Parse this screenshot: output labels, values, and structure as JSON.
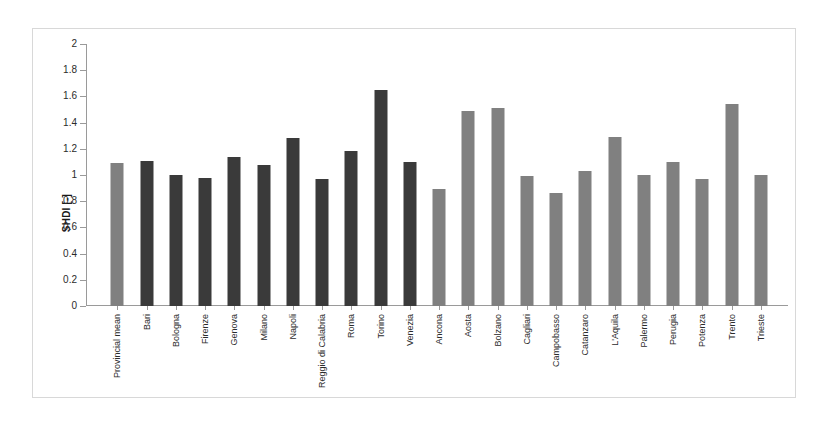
{
  "chart_data": {
    "type": "bar",
    "title": "",
    "xlabel": "",
    "ylabel": "SHDI [-]",
    "ylim": [
      0,
      2
    ],
    "ytick_labels": [
      "2",
      "1.8",
      "1.6",
      "1.4",
      "1.2",
      "1",
      "0.8",
      "0.6",
      "0.4",
      "0.2",
      "0"
    ],
    "ytick_values": [
      2,
      1.8,
      1.6,
      1.4,
      1.2,
      1,
      0.8,
      0.6,
      0.4,
      0.2,
      0
    ],
    "grid": false,
    "legend": "none",
    "categories": [
      "Provincial mean",
      "Bari",
      "Bologna",
      "Firenze",
      "Genova",
      "Milano",
      "Napoli",
      "Reggio di Calabria",
      "Roma",
      "Torino",
      "Venezia",
      "Ancona",
      "Aosta",
      "Bolzano",
      "Cagliari",
      "Campobasso",
      "Catanzaro",
      "L'Aquila",
      "Palermo",
      "Perugia",
      "Potenza",
      "Trento",
      "Trieste"
    ],
    "values": [
      1.09,
      1.11,
      1.0,
      0.98,
      1.14,
      1.08,
      1.28,
      0.97,
      1.18,
      1.65,
      1.1,
      0.89,
      1.49,
      1.51,
      0.99,
      0.86,
      1.03,
      1.29,
      1.0,
      1.1,
      0.97,
      1.54,
      1.0
    ],
    "bar_colors": [
      "light",
      "dark",
      "dark",
      "dark",
      "dark",
      "dark",
      "dark",
      "dark",
      "dark",
      "dark",
      "dark",
      "light",
      "light",
      "light",
      "light",
      "light",
      "light",
      "light",
      "light",
      "light",
      "light",
      "light",
      "light"
    ],
    "colors": {
      "metropolitan_bar": "#3a3a3a",
      "regional_capital_bar": "#808080",
      "axis": "#9a9a9a",
      "frame": "#d8d8d8",
      "text": "#2b2b2b",
      "background": "#ffffff"
    }
  }
}
